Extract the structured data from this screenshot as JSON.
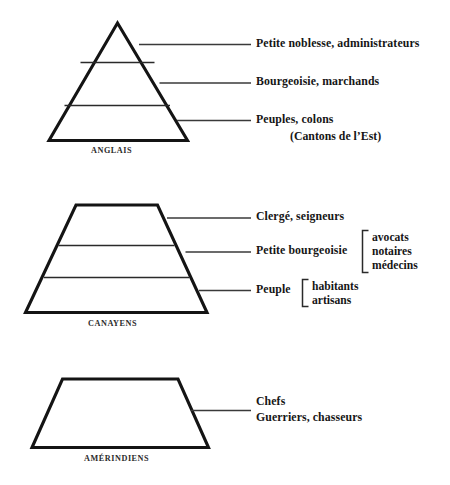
{
  "diagram": {
    "title_text": "",
    "ink_color": "#141414",
    "background_color": "#ffffff",
    "groups": [
      {
        "id": "anglais",
        "shape": "triangle",
        "caption": "ANGLAIS",
        "strata": [
          {
            "label": "Petite noblesse, administrateurs"
          },
          {
            "label": "Bourgeoisie, marchands"
          },
          {
            "label": "Peuples, colons",
            "label_second_line": "(Cantons de l’Est)"
          }
        ]
      },
      {
        "id": "canayens",
        "shape": "trapezoid",
        "caption": "CANAYENS",
        "strata": [
          {
            "label": "Clergé, seigneurs"
          },
          {
            "label": "Petite bourgeoisie",
            "brace_items": [
              "avocats",
              "notaires",
              "médecins"
            ]
          },
          {
            "label": "Peuple",
            "brace_items": [
              "habitants",
              "artisans"
            ]
          }
        ]
      },
      {
        "id": "amerindiens",
        "shape": "trapezoid",
        "caption": "AMÉRINDIENS",
        "strata": [
          {
            "label": "Chefs",
            "label_second_line": "Guerriers, chasseurs"
          }
        ]
      }
    ]
  }
}
